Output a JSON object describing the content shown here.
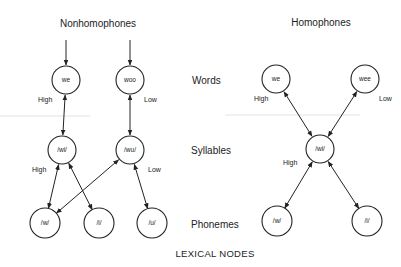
{
  "diagram": {
    "panels": [
      {
        "id": "nonhomophones",
        "title": "Nonhomophones",
        "nodes": [
          {
            "id": "we",
            "label": "we",
            "level": "words"
          },
          {
            "id": "woo",
            "label": "woo",
            "level": "words"
          },
          {
            "id": "syl_wi",
            "label": "/wi/",
            "level": "syllables"
          },
          {
            "id": "syl_wu",
            "label": "/wu/",
            "level": "syllables"
          },
          {
            "id": "ph_w",
            "label": "/w/",
            "level": "phonemes"
          },
          {
            "id": "ph_i",
            "label": "/i/",
            "level": "phonemes"
          },
          {
            "id": "ph_u",
            "label": "/u/",
            "level": "phonemes"
          }
        ],
        "edges": [
          {
            "from": "input",
            "to": "we",
            "type": "input"
          },
          {
            "from": "input",
            "to": "woo",
            "type": "input"
          },
          {
            "from": "we",
            "to": "syl_wi",
            "type": "bidirectional"
          },
          {
            "from": "woo",
            "to": "syl_wu",
            "type": "bidirectional"
          },
          {
            "from": "syl_wi",
            "to": "ph_w",
            "type": "bidirectional"
          },
          {
            "from": "syl_wi",
            "to": "ph_i",
            "type": "bidirectional"
          },
          {
            "from": "syl_wu",
            "to": "ph_w",
            "type": "bidirectional"
          },
          {
            "from": "syl_wu",
            "to": "ph_u",
            "type": "bidirectional"
          }
        ],
        "strength_labels": [
          {
            "text": "High",
            "near": "we"
          },
          {
            "text": "Low",
            "near": "woo"
          },
          {
            "text": "High",
            "near": "syl_wi"
          },
          {
            "text": "Low",
            "near": "syl_wu"
          }
        ]
      },
      {
        "id": "homophones",
        "title": "Homophones",
        "nodes": [
          {
            "id": "we",
            "label": "we",
            "level": "words"
          },
          {
            "id": "wee",
            "label": "wee",
            "level": "words"
          },
          {
            "id": "syl_wi",
            "label": "/wi/",
            "level": "syllables"
          },
          {
            "id": "ph_w",
            "label": "/w/",
            "level": "phonemes"
          },
          {
            "id": "ph_i",
            "label": "/i/",
            "level": "phonemes"
          }
        ],
        "edges": [
          {
            "from": "syl_wi",
            "to": "we",
            "type": "bidirectional"
          },
          {
            "from": "syl_wi",
            "to": "wee",
            "type": "bidirectional"
          },
          {
            "from": "syl_wi",
            "to": "ph_w",
            "type": "bidirectional"
          },
          {
            "from": "syl_wi",
            "to": "ph_i",
            "type": "bidirectional"
          }
        ],
        "strength_labels": [
          {
            "text": "High",
            "near": "we"
          },
          {
            "text": "Low",
            "near": "wee"
          },
          {
            "text": "High",
            "near": "syl_wi"
          }
        ]
      }
    ],
    "levels": [
      "Words",
      "Syllables",
      "Phonemes"
    ],
    "footer": "LEXICAL NODES"
  }
}
